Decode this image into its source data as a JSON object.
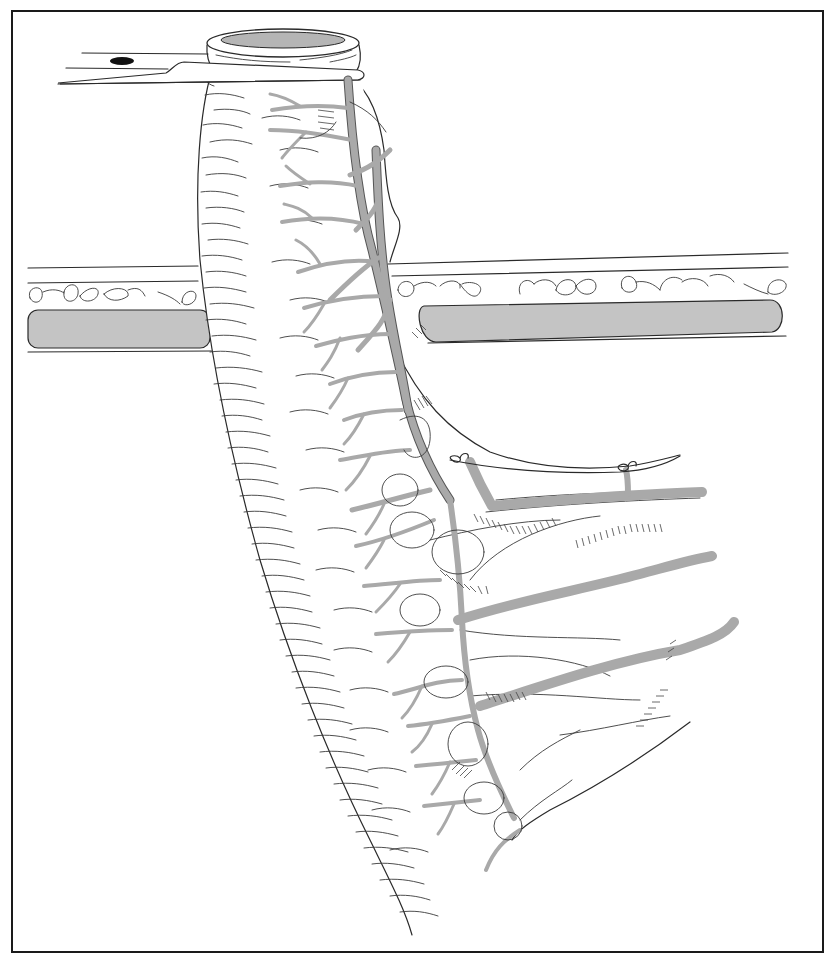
{
  "figure": {
    "width": 835,
    "height": 963,
    "frame": {
      "x": 12,
      "y": 11,
      "width": 811,
      "height": 941,
      "stroke": "#1a1a1a",
      "stroke_width": 2
    },
    "colors": {
      "background": "#ffffff",
      "line": "#2a2a2a",
      "vessel_fill": "#a9a9a9",
      "muscle_fill": "#c4c4c4",
      "lumen_fill": "#b5b5b5",
      "clamp_hole": "#111111"
    },
    "elements": [
      {
        "name": "bowel-segment",
        "description": "exteriorized intestinal loop with transverse serosal markings"
      },
      {
        "name": "bowel-lumen",
        "description": "open stoma end at top"
      },
      {
        "name": "supporting-rod",
        "description": "bridge/rod passed beneath bowel at top left"
      },
      {
        "name": "abdominal-wall",
        "description": "layered wall with fat lobules and gray muscle band"
      },
      {
        "name": "mesentery",
        "description": "mesenteric fan with branching gray vessels"
      },
      {
        "name": "ligature-ties",
        "count": 2,
        "description": "suture ties on vessel branches"
      }
    ]
  }
}
